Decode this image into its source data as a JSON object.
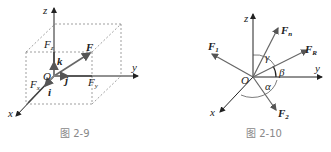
{
  "figures": [
    {
      "caption": "图 2-9",
      "labels": {
        "z": "z",
        "y": "y",
        "x": "x",
        "O": "O",
        "F": "F",
        "Fz": "F",
        "Fz_sub": "z",
        "Fy": "F",
        "Fy_sub": "y",
        "Fx": "F",
        "Fx_sub": "x",
        "i": "i",
        "j": "j",
        "k": "k"
      }
    },
    {
      "caption": "图 2-10",
      "labels": {
        "z": "z",
        "y": "y",
        "x": "x",
        "O": "O",
        "F1": "F",
        "F1_sub": "1",
        "F2": "F",
        "F2_sub": "2",
        "Fn": "F",
        "Fn_sub": "n",
        "FR": "F",
        "FR_sub": "R",
        "alpha": "α",
        "beta": "β",
        "gamma": "γ"
      }
    }
  ],
  "colors": {
    "axis": "#222222",
    "vector": "#666666",
    "dash": "#777777",
    "caption": "#888888"
  }
}
